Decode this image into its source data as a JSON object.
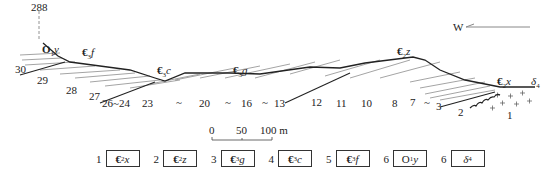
{
  "elevation_mark": "288",
  "direction": {
    "label": "W"
  },
  "units_on_profile": [
    {
      "id": "O1y",
      "main": "O",
      "sub": "1",
      "tail": "y"
    },
    {
      "id": "E3f",
      "main": "€",
      "sub": "3",
      "tail": "f"
    },
    {
      "id": "E3c",
      "main": "€",
      "sub": "3",
      "tail": "c"
    },
    {
      "id": "E3g",
      "main": "€",
      "sub": "3",
      "tail": "g"
    },
    {
      "id": "E2z",
      "main": "€",
      "sub": "2",
      "tail": "z"
    },
    {
      "id": "E2x",
      "main": "€",
      "sub": "2",
      "tail": "x"
    },
    {
      "id": "delta",
      "main": "δ",
      "sub": "4",
      "tail": ""
    }
  ],
  "bed_labels": [
    "30",
    "29",
    "28",
    "27",
    "26~24",
    "23",
    "~",
    "20",
    "~",
    "16",
    "~",
    "13",
    "12",
    "11",
    "10",
    "8",
    "7",
    "~",
    "3",
    "2",
    "1"
  ],
  "scale_bar": {
    "ticks": [
      "0",
      "50",
      "100 m"
    ]
  },
  "legend": [
    {
      "num": "1",
      "main": "€",
      "sub": "2",
      "tail": "x"
    },
    {
      "num": "2",
      "main": "€",
      "sub": "2",
      "tail": "z"
    },
    {
      "num": "3",
      "main": "€",
      "sub": "3",
      "tail": "g"
    },
    {
      "num": "4",
      "main": "€",
      "sub": "3",
      "tail": "c"
    },
    {
      "num": "5",
      "main": "€",
      "sub": "3",
      "tail": "f"
    },
    {
      "num": "6",
      "main": "O",
      "sub": "1",
      "tail": "y"
    },
    {
      "num": "6",
      "main": "δ",
      "sub": "4",
      "tail": ""
    }
  ]
}
